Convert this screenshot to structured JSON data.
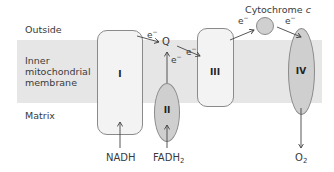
{
  "regions": {
    "outside": "Outside",
    "membrane": [
      "Inner",
      "mitochondrial",
      "membrane"
    ],
    "matrix": "Matrix"
  },
  "complexes": [
    {
      "id": "I",
      "label": "I",
      "shape": "rounded-rect"
    },
    {
      "id": "II",
      "label": "II",
      "shape": "oval"
    },
    {
      "id": "III",
      "label": "III",
      "shape": "rounded-rect"
    },
    {
      "id": "IV",
      "label": "IV",
      "shape": "oval"
    }
  ],
  "carriers": {
    "q": "Q",
    "cytochrome_c": {
      "name": "Cytochrome",
      "italic_suffix": "c"
    }
  },
  "electron_label": "e",
  "electron_charge": "−",
  "substrates": {
    "nadh": "NADH",
    "fadh2": {
      "base": "FADH",
      "subscript": "2"
    },
    "o2": {
      "base": "O",
      "subscript": "2"
    }
  },
  "colors": {
    "membrane_band": "#e6e6e6",
    "complex_light": "#f3f3f3",
    "complex_dark": "#cfcfcf",
    "outline": "#8a8a8a",
    "arrow": "#444444"
  }
}
